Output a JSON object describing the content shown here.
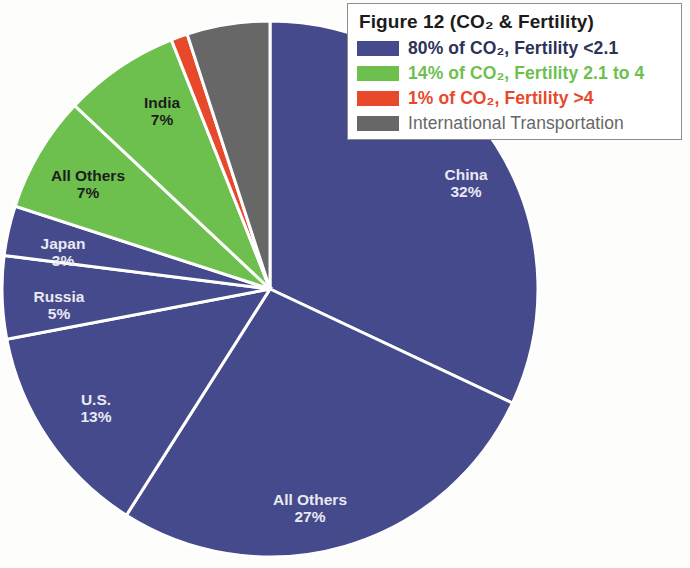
{
  "figure": {
    "legend_title": "Figure 12   (CO₂ & Fertility)",
    "legend_title_plain": "Figure 12 (CO2 & Fertility)"
  },
  "legend": {
    "items": [
      {
        "label": "80% of CO₂, Fertility <2.1",
        "color": "#454a8c",
        "text_color": "#2c3258"
      },
      {
        "label": "14% of CO₂, Fertility 2.1 to 4",
        "color": "#6ec04e",
        "text_color": "#6ec04e"
      },
      {
        "label": "1% of CO₂, Fertility >4",
        "color": "#e8492a",
        "text_color": "#e8492a"
      },
      {
        "label": "International Transportation",
        "color": "#676767",
        "text_color": "#676767"
      }
    ]
  },
  "chart_data": {
    "type": "pie",
    "title": "Figure 12   (CO₂ & Fertility)",
    "xlabel": "",
    "ylabel": "",
    "grid": false,
    "legend_position": "top-right",
    "units": "percent of global CO₂ emissions",
    "start_angle_deg": 0,
    "direction": "clockwise",
    "categories": [
      "China",
      "All Others (Fertility <2.1)",
      "U.S.",
      "Russia",
      "Japan",
      "All Others (Fertility 2.1 to 4)",
      "India",
      "Fertility >4",
      "International Transportation"
    ],
    "values": [
      32,
      27,
      13,
      5,
      3,
      7,
      7,
      1,
      5
    ],
    "slices": [
      {
        "name": "China",
        "value": 32,
        "label": "China",
        "percent_label": "32%",
        "color": "#454a8c",
        "group": "Fertility <2.1",
        "label_color": "light",
        "label_x": 466,
        "label_y": 176
      },
      {
        "name": "All Others (blue)",
        "value": 27,
        "label": "All Others",
        "percent_label": "27%",
        "color": "#454a8c",
        "group": "Fertility <2.1",
        "label_color": "light",
        "label_x": 310,
        "label_y": 501
      },
      {
        "name": "U.S.",
        "value": 13,
        "label": "U.S.",
        "percent_label": "13%",
        "color": "#454a8c",
        "group": "Fertility <2.1",
        "label_color": "light",
        "label_x": 96,
        "label_y": 401
      },
      {
        "name": "Russia",
        "value": 5,
        "label": "Russia",
        "percent_label": "5%",
        "color": "#454a8c",
        "group": "Fertility <2.1",
        "label_color": "light",
        "label_x": 59,
        "label_y": 298
      },
      {
        "name": "Japan",
        "value": 3,
        "label": "Japan",
        "percent_label": "3%",
        "color": "#454a8c",
        "group": "Fertility <2.1",
        "label_color": "light",
        "label_x": 63,
        "label_y": 245
      },
      {
        "name": "All Others (green)",
        "value": 7,
        "label": "All Others",
        "percent_label": "7%",
        "color": "#6ec04e",
        "group": "Fertility 2.1 to 4",
        "label_color": "dark",
        "label_x": 88,
        "label_y": 177
      },
      {
        "name": "India",
        "value": 7,
        "label": "India",
        "percent_label": "7%",
        "color": "#6ec04e",
        "group": "Fertility 2.1 to 4",
        "label_color": "dark",
        "label_x": 162,
        "label_y": 104
      },
      {
        "name": "Fertility >4",
        "value": 1,
        "label": "",
        "percent_label": "",
        "color": "#e8492a",
        "group": "Fertility >4",
        "label_color": "dark",
        "label_x": 0,
        "label_y": 0
      },
      {
        "name": "International Transportation",
        "value": 5,
        "label": "",
        "percent_label": "",
        "color": "#676767",
        "group": "International Transportation",
        "label_color": "light",
        "label_x": 0,
        "label_y": 0
      }
    ],
    "geometry": {
      "center_x": 270,
      "center_y": 289,
      "radius": 268,
      "separator_color": "#ffffff",
      "separator_width": 3
    }
  }
}
